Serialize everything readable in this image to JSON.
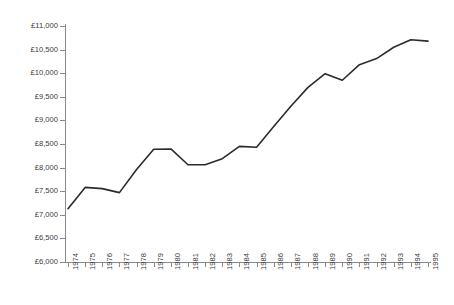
{
  "chart_data": {
    "type": "line",
    "title": "",
    "subtitle": "",
    "xlabel": "",
    "ylabel": "",
    "grid": false,
    "legend": false,
    "legend_position": "none",
    "currency_symbol": "£",
    "line_color": "#2b2b2b",
    "axis_color": "#8a8a8a",
    "text_color": "#3a3a3a",
    "background": "#ffffff",
    "ylim": [
      6000,
      11000
    ],
    "ytick_step": 500,
    "ytick_labels": [
      "£11,000",
      "£10,500",
      "£10,000",
      "£9,500",
      "£9,000",
      "£8,500",
      "£8,000",
      "£7,500",
      "£7,000",
      "£6,500",
      "£6,000"
    ],
    "ytick_values": [
      11000,
      10500,
      10000,
      9500,
      9000,
      8500,
      8000,
      7500,
      7000,
      6500,
      6000
    ],
    "categories": [
      "1974",
      "1975",
      "1976",
      "1977",
      "1978",
      "1979",
      "1980",
      "1981",
      "1982",
      "1983",
      "1984",
      "1985",
      "1986",
      "1987",
      "1988",
      "1989",
      "1990",
      "1991",
      "1992",
      "1993",
      "1994",
      "1995"
    ],
    "values": [
      7130,
      7580,
      7555,
      7470,
      7960,
      8390,
      8395,
      8060,
      8060,
      8190,
      8450,
      8430,
      8870,
      9300,
      9700,
      9990,
      9850,
      10180,
      10310,
      10550,
      10710,
      10680
    ],
    "series": [
      {
        "name": "value",
        "values": [
          7130,
          7580,
          7555,
          7470,
          7960,
          8390,
          8395,
          8060,
          8060,
          8190,
          8450,
          8430,
          8870,
          9300,
          9700,
          9990,
          9850,
          10180,
          10310,
          10550,
          10710,
          10680
        ]
      }
    ]
  }
}
